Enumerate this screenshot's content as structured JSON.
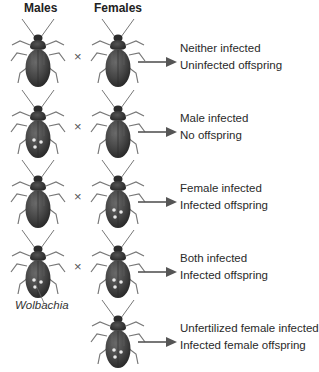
{
  "headers": {
    "males": "Males",
    "females": "Females"
  },
  "cross_symbol": "×",
  "annotation": {
    "wolbachia": "Wolbachia"
  },
  "colors": {
    "beetle_body": "#4a4a4a",
    "beetle_dark": "#2e2e2e",
    "spots": "#e8e8e8",
    "arrow": "#555555",
    "text": "#2a2a2a"
  },
  "rows": [
    {
      "male_infected": false,
      "female_infected": false,
      "condition": "Neither infected",
      "outcome": "Uninfected offspring"
    },
    {
      "male_infected": true,
      "female_infected": false,
      "condition": "Male infected",
      "outcome": "No offspring"
    },
    {
      "male_infected": false,
      "female_infected": true,
      "condition": "Female infected",
      "outcome": "Infected offspring"
    },
    {
      "male_infected": true,
      "female_infected": true,
      "condition": "Both infected",
      "outcome": "Infected offspring"
    },
    {
      "male_present": false,
      "female_infected": true,
      "condition": "Unfertilized female infected",
      "outcome": "Infected female offspring"
    }
  ]
}
